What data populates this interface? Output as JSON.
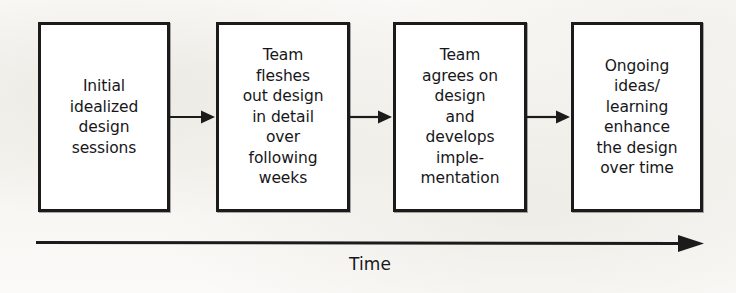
{
  "diagram": {
    "orientation": "left-to-right",
    "background_color": "#faf9f7",
    "box_fill_color": "#ffffff",
    "stroke_color": "#1b1b1b",
    "text_color": "#17171a",
    "stages": [
      {
        "id": "stage-1",
        "text": "Initial\nidealized\ndesign\nsessions",
        "lines": [
          "Initial",
          "idealized",
          "design",
          "sessions"
        ]
      },
      {
        "id": "stage-2",
        "text": "Team\nfleshes\nout design\nin detail\nover\nfollowing\nweeks",
        "lines": [
          "Team",
          "fleshes",
          "out design",
          "in detail",
          "over",
          "following",
          "weeks"
        ]
      },
      {
        "id": "stage-3",
        "text": "Team\nagrees on\ndesign\nand\ndevelops\nimple-\nmentation",
        "lines": [
          "Team",
          "agrees on",
          "design",
          "and",
          "develops",
          "imple-",
          "mentation"
        ]
      },
      {
        "id": "stage-4",
        "text": "Ongoing\nideas/\nlearning\nenhance\nthe design\nover time",
        "lines": [
          "Ongoing",
          "ideas/",
          "learning",
          "enhance",
          "the design",
          "over time"
        ]
      }
    ],
    "connectors": [
      {
        "id": "connector-1-2",
        "from": "stage-1",
        "to": "stage-2",
        "style": "solid-arrow"
      },
      {
        "id": "connector-2-3",
        "from": "stage-2",
        "to": "stage-3",
        "style": "solid-arrow"
      },
      {
        "id": "connector-3-4",
        "from": "stage-3",
        "to": "stage-4",
        "style": "solid-arrow"
      }
    ],
    "axis": {
      "label": "Time",
      "direction": "rightward",
      "style": "solid-arrow"
    }
  }
}
